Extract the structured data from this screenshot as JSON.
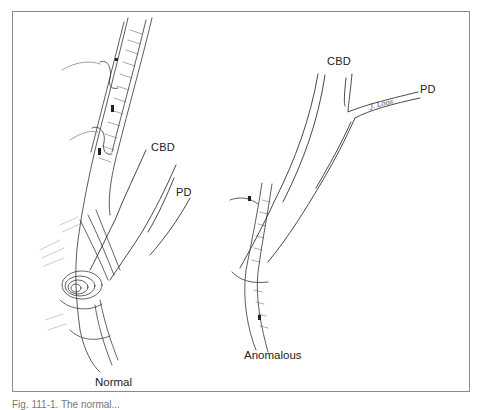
{
  "figure": {
    "panels": [
      {
        "id": "normal",
        "title": "Normal",
        "labels": [
          "CBD",
          "PD"
        ]
      },
      {
        "id": "anomalous",
        "title": "Anomalous",
        "labels": [
          "CBD",
          "PD"
        ],
        "signature": "J. Loos"
      }
    ],
    "caption": "Fig. 111-1. The normal..."
  }
}
